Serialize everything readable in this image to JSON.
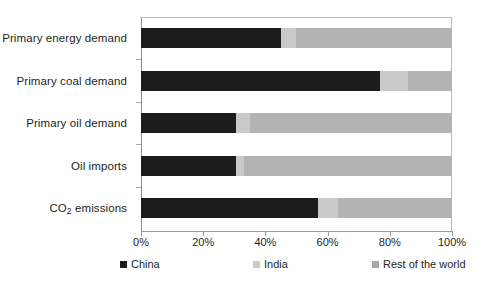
{
  "chart_data": {
    "type": "bar",
    "orientation": "horizontal",
    "stacked": true,
    "normalized": true,
    "title": "",
    "subtitle": "",
    "xlabel": "",
    "ylabel": "",
    "xlim": [
      0,
      100
    ],
    "xtick_labels": [
      "0%",
      "20%",
      "40%",
      "60%",
      "80%",
      "100%"
    ],
    "xtick_values": [
      0,
      20,
      40,
      60,
      80,
      100
    ],
    "grid": false,
    "legend_position": "bottom",
    "categories": [
      "Primary energy demand",
      "Primary coal demand",
      "Primary oil demand",
      "Oil imports",
      "CO2 emissions"
    ],
    "category_labels_html": [
      "Primary energy demand",
      "Primary coal demand",
      "Primary oil demand",
      "Oil imports",
      "CO<sub>2</sub> emissions"
    ],
    "series": [
      {
        "name": "China",
        "color": "#1c1c1c",
        "values": [
          45,
          77,
          30.5,
          30.5,
          57
        ]
      },
      {
        "name": "India",
        "color": "#c9c9c9",
        "values": [
          5,
          9,
          4.5,
          2.5,
          6.5
        ]
      },
      {
        "name": "Rest of the world",
        "color": "#b3b3b3",
        "values": [
          50,
          14,
          65,
          67,
          36.5
        ]
      }
    ]
  },
  "legend": {
    "items": [
      {
        "label": "China",
        "color": "#1c1c1c"
      },
      {
        "label": "India",
        "color": "#c9c9c9"
      },
      {
        "label": "Rest of the world",
        "color": "#a9a9a9"
      }
    ]
  },
  "axis": {
    "tick_labels": [
      "0%",
      "20%",
      "40%",
      "60%",
      "80%",
      "100%"
    ]
  }
}
